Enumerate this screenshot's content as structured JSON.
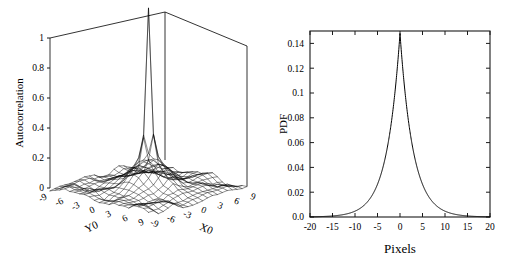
{
  "figure": {
    "background": "#ffffff",
    "line_color": "#000000"
  },
  "panels": [
    {
      "id": "left",
      "name": "autocorrelation-surface-panel"
    },
    {
      "id": "right",
      "name": "pdf-line-panel"
    }
  ],
  "chart_data": [
    {
      "type": "surface",
      "name": "autocorrelation-surface",
      "title": "",
      "xlabel": "X0",
      "ylabel": "Y0",
      "zlabel": "Autocorrelation",
      "xticks": [
        -9,
        -6,
        -3,
        0,
        3,
        6,
        9
      ],
      "xtick_labels": [
        "-9",
        "-6",
        "-3",
        "0",
        "3",
        "6",
        "9"
      ],
      "yticks": [
        -9,
        -6,
        -3,
        0,
        3,
        6,
        9
      ],
      "ytick_labels": [
        "-9",
        "-6",
        "-3",
        "0",
        "3",
        "6",
        "9"
      ],
      "zticks": [
        0,
        0.2,
        0.4,
        0.6,
        0.8,
        1
      ],
      "ztick_labels": [
        "0",
        "0.2",
        "0.4",
        "0.6",
        "0.8",
        "1"
      ],
      "xlim": [
        -10,
        10
      ],
      "ylim": [
        -10,
        10
      ],
      "zlim": [
        0,
        1
      ],
      "grid": false,
      "legend": "none",
      "description": "Mesh surface of 2D autocorrelation with a sharp narrow central peak reaching 1.0 at (0,0), a broad secondary shoulder near 0.2, and low-amplitude noisy ripples across the base plane.",
      "peak": {
        "x": 0,
        "y": 0,
        "z": 1.0
      },
      "shoulder_level": 0.2,
      "baseline_noise": 0.03,
      "projection": "3d-wireframe",
      "grid_n": 21
    },
    {
      "type": "line",
      "name": "pdf-curve",
      "title": "",
      "xlabel": "Pixels",
      "ylabel": "PDF",
      "xticks": [
        -20,
        -15,
        -10,
        -5,
        0,
        5,
        10,
        15,
        20
      ],
      "xtick_labels": [
        "-20",
        "-15",
        "-10",
        "-5",
        "0",
        "5",
        "10",
        "15",
        "20"
      ],
      "yticks": [
        0,
        0.02,
        0.04,
        0.06,
        0.08,
        0.1,
        0.12,
        0.14
      ],
      "ytick_labels": [
        "0.0",
        "0.02",
        "0.04",
        "0.06",
        "0.08",
        "0.1",
        "0.12",
        "0.14"
      ],
      "xlim": [
        -20,
        20
      ],
      "ylim": [
        0,
        0.15
      ],
      "grid": false,
      "legend": "none",
      "peak": {
        "x": 0,
        "y": 0.148
      },
      "description": "Sharply peaked symmetric heavy-tailed (Laplace-like) probability density centred at 0 pixels, peak value about 0.148, decaying to near zero by +/-15 pixels.",
      "x": [
        -20,
        -19,
        -18,
        -17,
        -16,
        -15,
        -14,
        -13,
        -12,
        -11,
        -10,
        -9,
        -8,
        -7,
        -6,
        -5,
        -4,
        -3,
        -2.5,
        -2,
        -1.5,
        -1,
        -0.5,
        0,
        0.5,
        1,
        1.5,
        2,
        2.5,
        3,
        4,
        5,
        6,
        7,
        8,
        9,
        10,
        11,
        12,
        13,
        14,
        15,
        16,
        17,
        18,
        19,
        20
      ],
      "y": [
        0.0005,
        0.0006,
        0.0008,
        0.001,
        0.0013,
        0.0017,
        0.0022,
        0.0029,
        0.0038,
        0.005,
        0.0066,
        0.0087,
        0.0115,
        0.0152,
        0.02,
        0.0264,
        0.0348,
        0.0459,
        0.0527,
        0.0605,
        0.0695,
        0.0798,
        0.101,
        0.148,
        0.101,
        0.0798,
        0.0695,
        0.0605,
        0.0527,
        0.0459,
        0.0348,
        0.0264,
        0.02,
        0.0152,
        0.0115,
        0.0087,
        0.0066,
        0.005,
        0.0038,
        0.0029,
        0.0022,
        0.0017,
        0.0013,
        0.001,
        0.0008,
        0.0006,
        0.0005
      ]
    }
  ]
}
